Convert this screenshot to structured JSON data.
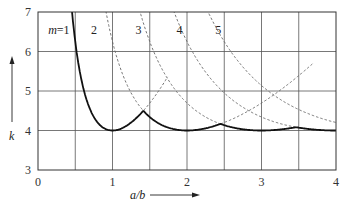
{
  "chart_data": {
    "type": "line",
    "title": "",
    "xlabel": "a/b",
    "ylabel": "k",
    "xlim": [
      0,
      4
    ],
    "ylim": [
      3,
      7
    ],
    "grid": true,
    "x_gridlines": [
      0.5,
      1,
      1.5,
      2,
      2.5,
      3,
      3.5
    ],
    "y_gridlines": [
      4,
      5,
      6
    ],
    "x_ticks": [
      "0",
      "1",
      "2",
      "3",
      "4"
    ],
    "y_ticks": [
      "3",
      "4",
      "5",
      "6",
      "7"
    ],
    "formula": "k = (m*b/a + a/(m*b))^2",
    "series": [
      {
        "name": "m=1",
        "m": 1,
        "label_text": "m=1",
        "label_at": [
          0.28,
          6.55
        ]
      },
      {
        "name": "m=2",
        "m": 2,
        "label_text": "2",
        "label_at": [
          0.75,
          6.55
        ]
      },
      {
        "name": "m=3",
        "m": 3,
        "label_text": "3",
        "label_at": [
          1.35,
          6.55
        ]
      },
      {
        "name": "m=4",
        "m": 4,
        "label_text": "4",
        "label_at": [
          1.9,
          6.55
        ]
      },
      {
        "name": "m=5",
        "m": 5,
        "label_text": "5",
        "label_at": [
          2.42,
          6.55
        ]
      }
    ],
    "envelope_minima": [
      {
        "a_b": 1,
        "k": 4
      },
      {
        "a_b": 2,
        "k": 4
      },
      {
        "a_b": 3,
        "k": 4
      },
      {
        "a_b": 4,
        "k": 4
      }
    ],
    "envelope_peaks": [
      {
        "a_b": 1.41,
        "k": 4.5
      },
      {
        "a_b": 2.45,
        "k": 4.17
      },
      {
        "a_b": 3.46,
        "k": 4.08
      }
    ],
    "dashed_right_branch_ends": [
      {
        "m": 1,
        "a_b": 1.75,
        "k": 5.9
      },
      {
        "m": 2,
        "a_b": 3.7,
        "k": 6.3
      }
    ],
    "legend": "none"
  },
  "labels": {
    "x_axis": "a/b",
    "y_axis": "k"
  }
}
